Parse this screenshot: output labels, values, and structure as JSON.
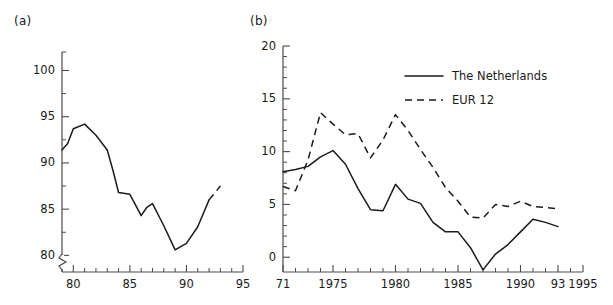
{
  "figure": {
    "panel_a_label": "(a)",
    "panel_b_label": "(b)"
  },
  "chart_data": [
    {
      "id": "panel-a",
      "type": "line",
      "title": "",
      "subtitle": "",
      "xlabel": "",
      "ylabel": "",
      "xlim": [
        79,
        95
      ],
      "ylim": [
        78.2,
        102
      ],
      "grid": false,
      "legend": null,
      "y_axis_break": true,
      "xticks_major": [
        80,
        85,
        90,
        95
      ],
      "xticklabels": [
        "80",
        "85",
        "90",
        "95"
      ],
      "xticks_minor": [
        79,
        81,
        82,
        83,
        84,
        86,
        87,
        88,
        89,
        91,
        92,
        93,
        94
      ],
      "yticks_major": [
        80,
        85,
        90,
        95,
        100
      ],
      "yticklabels": [
        "80",
        "85",
        "90",
        "95",
        "100"
      ],
      "yticks_minor": [
        82.5,
        87.5,
        92.5,
        97.5,
        102
      ],
      "series": [
        {
          "name": "solid-observed",
          "style": "solid",
          "x": [
            79,
            79.5,
            80,
            81,
            82,
            83,
            83.5,
            84,
            85,
            86,
            86.5,
            87,
            88,
            89,
            90,
            91,
            92
          ],
          "values": [
            91.4,
            92.1,
            93.7,
            94.2,
            93.0,
            91.4,
            89.2,
            86.8,
            86.6,
            84.3,
            85.2,
            85.6,
            83.2,
            80.6,
            81.3,
            83.1,
            86.0
          ]
        },
        {
          "name": "dashed-forecast",
          "style": "dashed",
          "x": [
            92,
            93
          ],
          "values": [
            86.0,
            87.5
          ]
        }
      ]
    },
    {
      "id": "panel-b",
      "type": "line",
      "title": "",
      "subtitle": "",
      "xlabel": "",
      "ylabel": "",
      "xlim": [
        1971,
        1995
      ],
      "ylim": [
        -1.4,
        20
      ],
      "grid": false,
      "legend_position": "upper-right",
      "xticks_major": [
        1971,
        1975,
        1980,
        1985,
        1990,
        1993,
        1995
      ],
      "xticklabels": [
        "71",
        "1975",
        "1980",
        "1985",
        "1990",
        "93",
        "1995"
      ],
      "xticks_minor": [
        1972,
        1973,
        1974,
        1976,
        1977,
        1978,
        1979,
        1981,
        1982,
        1983,
        1984,
        1986,
        1987,
        1988,
        1989,
        1991,
        1992,
        1994
      ],
      "yticks_major": [
        0,
        5,
        10,
        15,
        20
      ],
      "yticklabels": [
        "0",
        "5",
        "10",
        "15",
        "20"
      ],
      "yticks_minor": [
        1,
        2,
        3,
        4,
        6,
        7,
        8,
        9,
        11,
        12,
        13,
        14,
        16,
        17,
        18,
        19
      ],
      "series": [
        {
          "name": "The Netherlands",
          "style": "solid",
          "x": [
            1971,
            1972,
            1973,
            1974,
            1975,
            1976,
            1977,
            1978,
            1979,
            1980,
            1981,
            1982,
            1983,
            1984,
            1985,
            1986,
            1987,
            1988,
            1989,
            1990,
            1991,
            1992,
            1993
          ],
          "values": [
            8.1,
            8.3,
            8.6,
            9.5,
            10.1,
            8.8,
            6.5,
            4.5,
            4.4,
            6.9,
            5.5,
            5.1,
            3.3,
            2.4,
            2.4,
            0.9,
            -1.2,
            0.3,
            1.2,
            2.4,
            3.6,
            3.3,
            2.9
          ]
        },
        {
          "name": "EUR 12",
          "style": "dashed",
          "x": [
            1971,
            1972,
            1973,
            1974,
            1975,
            1976,
            1977,
            1978,
            1979,
            1980,
            1981,
            1982,
            1983,
            1984,
            1985,
            1986,
            1987,
            1988,
            1989,
            1990,
            1991,
            1992,
            1993
          ],
          "values": [
            6.7,
            6.3,
            9.2,
            13.7,
            12.6,
            11.6,
            11.7,
            9.4,
            11.1,
            13.5,
            12.0,
            10.2,
            8.5,
            6.6,
            5.3,
            3.8,
            3.7,
            5.0,
            4.8,
            5.3,
            4.8,
            4.7,
            4.6
          ]
        }
      ]
    }
  ],
  "legend": {
    "items": [
      {
        "label": "The Netherlands",
        "style": "solid"
      },
      {
        "label": "EUR 12",
        "style": "dashed"
      }
    ]
  }
}
